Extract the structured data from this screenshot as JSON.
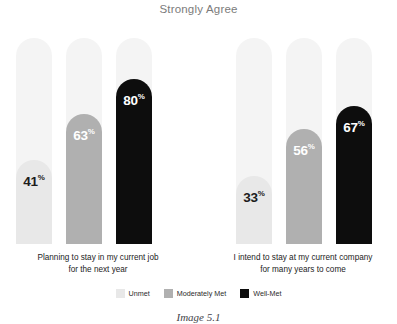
{
  "chart_data": {
    "type": "bar",
    "title": "Strongly Agree",
    "xlabel": "",
    "ylabel": "",
    "ylim": [
      0,
      100
    ],
    "grid": false,
    "legend_position": "bottom",
    "value_suffix": "%",
    "categories": [
      "Planning to stay in my current job for the next year",
      "I intend to stay at my current company for many years to come"
    ],
    "series": [
      {
        "name": "Unmet",
        "color": "#e8e8e8",
        "label_color": "#1c1c1c",
        "values": [
          41,
          33
        ]
      },
      {
        "name": "Moderately Met",
        "color": "#b0b0b0",
        "label_color": "#ffffff",
        "values": [
          63,
          56
        ]
      },
      {
        "name": "Well-Met",
        "color": "#0d0d0d",
        "label_color": "#ffffff",
        "values": [
          80,
          67
        ]
      }
    ],
    "track_color": "#f4f4f4"
  },
  "groups": [
    {
      "label_line1": "Planning to stay in my current job",
      "label_line2": "for the next year",
      "bars": [
        {
          "value": "41",
          "suffix": "%"
        },
        {
          "value": "63",
          "suffix": "%"
        },
        {
          "value": "80",
          "suffix": "%"
        }
      ]
    },
    {
      "label_line1": "I intend to stay at my current company",
      "label_line2": "for many years to come",
      "bars": [
        {
          "value": "33",
          "suffix": "%"
        },
        {
          "value": "56",
          "suffix": "%"
        },
        {
          "value": "67",
          "suffix": "%"
        }
      ]
    }
  ],
  "legend": {
    "items": [
      {
        "label": "Unmet"
      },
      {
        "label": "Moderately Met"
      },
      {
        "label": "Well-Met"
      }
    ]
  },
  "caption": "Image 5.1"
}
